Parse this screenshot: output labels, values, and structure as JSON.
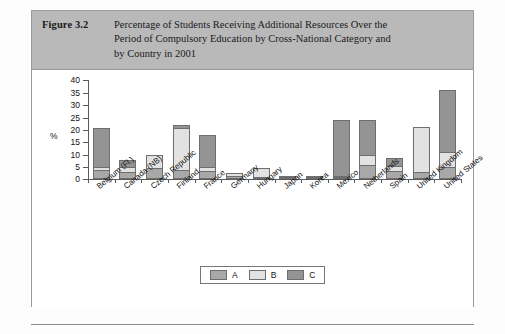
{
  "figure": {
    "label": "Figure 3.2",
    "caption_lines": [
      "Percentage of Students Receiving Additional Resources Over the",
      "Period of Compulsory Education by Cross-National Category and",
      "by Country in 2001"
    ]
  },
  "chart_data": {
    "type": "bar",
    "stacked": true,
    "title": "Percentage of Students Receiving Additional Resources Over the Period of Compulsory Education by Cross-National Category and by Country in 2001",
    "xlabel": "",
    "ylabel": "%",
    "ylim": [
      0,
      40
    ],
    "yticks": [
      0,
      5,
      10,
      15,
      20,
      25,
      30,
      35,
      40
    ],
    "ytick_labels": [
      "0",
      "5",
      "10",
      "15",
      "20",
      "25",
      "30",
      "35",
      "40"
    ],
    "grid": false,
    "legend_position": "bottom-center",
    "categories": [
      "Belgium (Fl.)",
      "Canada (NB)",
      "Czech Republic",
      "Finland",
      "France",
      "Germany",
      "Hungary",
      "Japan",
      "Korea",
      "Mexico",
      "Netherlands",
      "Spain",
      "United Kingdom",
      "United States"
    ],
    "series": [
      {
        "name": "A",
        "color": "#a8a8a8",
        "values": [
          4.0,
          3.0,
          4.5,
          4.0,
          3.5,
          1.5,
          0.5,
          0.5,
          0.2,
          1.0,
          6.0,
          3.5,
          3.0,
          5.0
        ]
      },
      {
        "name": "B",
        "color": "#e2e2e2",
        "values": [
          1.0,
          2.0,
          5.5,
          17.0,
          1.5,
          1.0,
          4.0,
          0.5,
          0.1,
          0.5,
          4.0,
          2.0,
          18.0,
          6.0
        ]
      },
      {
        "name": "C",
        "color": "#949494",
        "values": [
          16.0,
          3.0,
          0.0,
          1.0,
          13.0,
          0.0,
          0.0,
          0.0,
          0.0,
          22.5,
          14.0,
          3.0,
          0.0,
          25.0
        ]
      }
    ],
    "totals": [
      21.0,
      8.0,
      10.0,
      22.0,
      18.0,
      2.5,
      4.5,
      1.0,
      0.3,
      24.0,
      24.0,
      8.5,
      21.0,
      36.0
    ]
  },
  "legend": {
    "items": [
      {
        "label": "A",
        "color": "#a8a8a8"
      },
      {
        "label": "B",
        "color": "#e2e2e2"
      },
      {
        "label": "C",
        "color": "#949494"
      }
    ]
  },
  "colors": {
    "caption_bar": "#b9b9b9",
    "series_a": "#a8a8a8",
    "series_b": "#e2e2e2",
    "series_c": "#949494",
    "axis": "#5a5a5a",
    "border": "#9a9a9a"
  }
}
